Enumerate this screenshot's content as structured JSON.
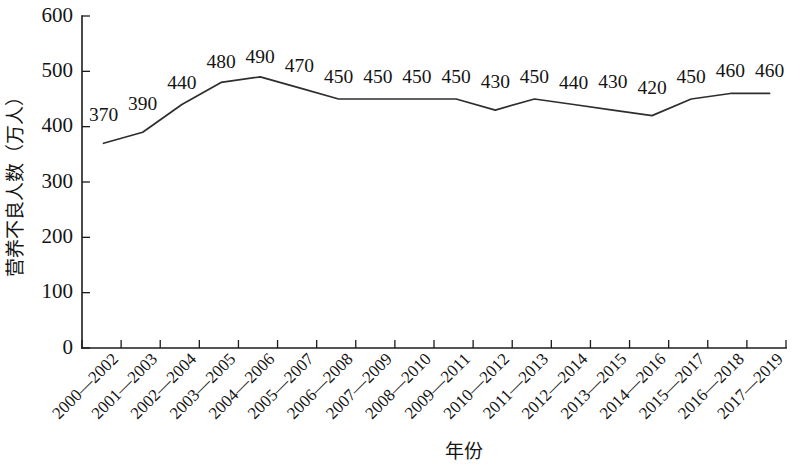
{
  "chart_data": {
    "type": "line",
    "title": "",
    "xlabel": "年份",
    "ylabel": "营养不良人数（万人）",
    "categories": [
      "2000—2002",
      "2001—2003",
      "2002—2004",
      "2003—2005",
      "2004—2006",
      "2005—2007",
      "2006—2008",
      "2007—2009",
      "2008—2010",
      "2009—2011",
      "2010—2012",
      "2011—2013",
      "2012—2014",
      "2013—2015",
      "2014—2016",
      "2015—2017",
      "2016—2018",
      "2017—2019"
    ],
    "values": [
      370,
      390,
      440,
      480,
      490,
      470,
      450,
      450,
      450,
      450,
      430,
      450,
      440,
      430,
      420,
      450,
      460,
      460
    ],
    "value_labels": [
      "370",
      "390",
      "440",
      "480",
      "490",
      "470",
      "450",
      "450",
      "450",
      "450",
      "430",
      "450",
      "440",
      "430",
      "420",
      "450",
      "460",
      "460"
    ],
    "ylim": [
      0,
      600
    ],
    "ytick_values": [
      0,
      100,
      200,
      300,
      400,
      500,
      600
    ],
    "ytick_labels": [
      "0",
      "100",
      "200",
      "300",
      "400",
      "500",
      "600"
    ],
    "grid": false,
    "legend": false,
    "series_color": "#2e2e2e",
    "axis_color": "#1c1c1c",
    "xtick_rotation_deg": -45
  }
}
